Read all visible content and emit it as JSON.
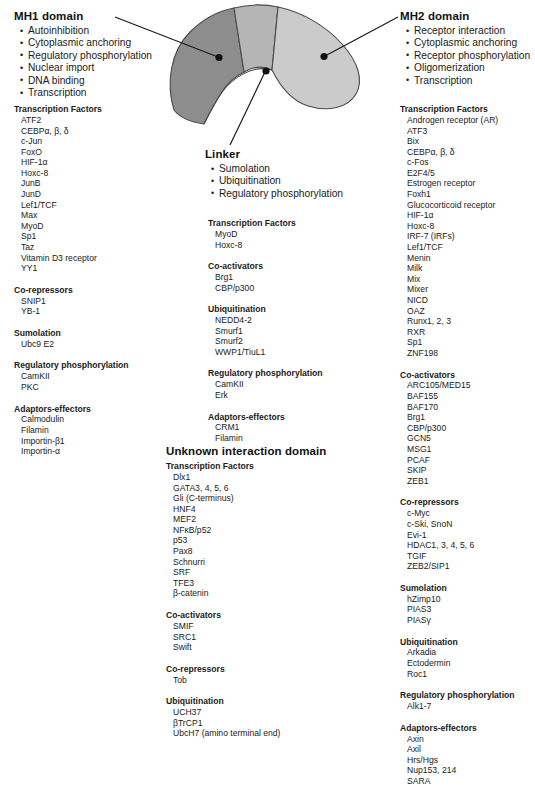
{
  "figure": {
    "colors": {
      "mh1_fill": "#8d8d8d",
      "linker_fill": "#b5b5b5",
      "mh2_fill": "#cbcbcb",
      "outline": "#4a4a4a",
      "leader": "#1a1a1a",
      "text": "#1a1a1a"
    }
  },
  "mh1": {
    "title": "MH1 domain",
    "functions": [
      "Autoinhibition",
      "Cytoplasmic anchoring",
      "Regulatory phosphorylation",
      "Nuclear import",
      "DNA binding",
      "Transcription"
    ],
    "groups": [
      {
        "title": "Transcription Factors",
        "items": [
          "ATF2",
          "CEBP&alpha;, &beta;, &delta;",
          "c-Jun",
          "FoxO",
          "HIF-1&alpha;",
          "Hoxc-8",
          "JunB",
          "JunD",
          "Lef1/TCF",
          "Max",
          "MyoD",
          "Sp1",
          "Taz",
          "Vitamin D3 receptor",
          "YY1"
        ]
      },
      {
        "title": "Co-repressors",
        "items": [
          "SNIP1",
          "YB-1"
        ]
      },
      {
        "title": "Sumolation",
        "items": [
          "Ubc9 E2"
        ]
      },
      {
        "title": "Regulatory phosphorylation",
        "items": [
          "CamKII",
          "PKC"
        ]
      },
      {
        "title": "Adaptors-effectors",
        "items": [
          "Calmodulin",
          "Filamin",
          "Importin-&beta;1",
          "Importin-&alpha;"
        ]
      }
    ]
  },
  "linker": {
    "title": "Linker",
    "functions": [
      "Sumolation",
      "Ubiquitination",
      "Regulatory phosphorylation"
    ],
    "groups": [
      {
        "title": "Transcription Factors",
        "items": [
          "MyoD",
          "Hoxc-8"
        ]
      },
      {
        "title": "Co-activators",
        "items": [
          "Brg1",
          "CBP/p300"
        ]
      },
      {
        "title": "Ubiquitination",
        "items": [
          "NEDD4-2",
          "Smurf1",
          "Smurf2",
          "WWP1/TiuL1"
        ]
      },
      {
        "title": "Regulatory phosphorylation",
        "items": [
          "CamKII",
          "Erk"
        ]
      },
      {
        "title": "Adaptors-effectors",
        "items": [
          "CRM1",
          "Filamin"
        ]
      }
    ]
  },
  "unknown": {
    "title": "Unknown interaction domain",
    "groups": [
      {
        "title": "Transcription Factors",
        "items": [
          "Dlx1",
          "GATA3, 4, 5, 6",
          "Gli (C-terminus)",
          "HNF4",
          "MEF2",
          "NF&kappa;B/p52",
          "p53",
          "Pax8",
          "Schnurri",
          "SRF",
          "TFE3",
          "&beta;-catenin"
        ]
      },
      {
        "title": "Co-activators",
        "items": [
          "SMIF",
          "SRC1",
          "Swift"
        ]
      },
      {
        "title": "Co-repressors",
        "items": [
          "Tob"
        ]
      },
      {
        "title": "Ubiquitination",
        "items": [
          "UCH37",
          "&beta;TrCP1",
          "UbcH7  (amino terminal end)"
        ]
      }
    ]
  },
  "mh2": {
    "title": "MH2 domain",
    "functions": [
      "Receptor interaction",
      "Cytoplasmic anchoring",
      "Receptor phosphorylation",
      "Oligomerization",
      "Transcription"
    ],
    "groups": [
      {
        "title": "Transcription Factors",
        "items": [
          "Androgen receptor (AR)",
          "ATF3",
          "Bix",
          "CEBP&alpha;, &beta;, &delta;",
          "c-Fos",
          "E2F4/5",
          "Estrogen receptor",
          "Foxh1",
          "Glucocorticoid receptor",
          "HIF-1&alpha;",
          "Hoxc-8",
          "IRF-7 (IRFs)",
          "Lef1/TCF",
          "Menin",
          "Milk",
          "Mix",
          "Mixer",
          "NICD",
          "OAZ",
          "Runx1, 2, 3",
          "RXR",
          "Sp1",
          "ZNF198"
        ]
      },
      {
        "title": "Co-activators",
        "items": [
          "ARC105/MED15",
          "BAF155",
          "BAF170",
          "Brg1",
          "CBP/p300",
          "GCN5",
          "MSG1",
          "PCAF",
          "SKIP",
          "ZEB1"
        ]
      },
      {
        "title": "Co-repressors",
        "items": [
          "c-Myc",
          "c-Ski, SnoN",
          "Evi-1",
          "HDAC1, 3, 4, 5, 6",
          "TGIF",
          "ZEB2/SIP1"
        ]
      },
      {
        "title": "Sumolation",
        "items": [
          "hZimp10",
          "PIAS3",
          "PIAS&gamma;"
        ]
      },
      {
        "title": "Ubiquitination",
        "items": [
          "Arkadia",
          "Ectodermin",
          "Roc1"
        ]
      },
      {
        "title": "Regulatory phosphorylation",
        "items": [
          "Alk1-7"
        ]
      },
      {
        "title": "Adaptors-effectors",
        "items": [
          "Axin",
          "Axil",
          "Hrs/Hgs",
          "Nup153, 214",
          "SARA"
        ]
      }
    ]
  }
}
